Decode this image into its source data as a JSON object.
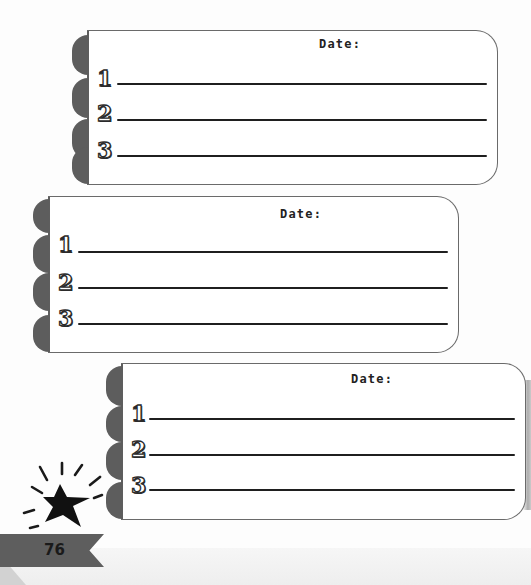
{
  "page": {
    "number": "76",
    "colors": {
      "accent_gray": "#5e5e5e",
      "ink": "#1f1f1f",
      "paper": "#ffffff"
    }
  },
  "cards": [
    {
      "date_label": "Date:",
      "items": [
        {
          "number": "1",
          "value": ""
        },
        {
          "number": "2",
          "value": ""
        },
        {
          "number": "3",
          "value": ""
        }
      ]
    },
    {
      "date_label": "Date:",
      "items": [
        {
          "number": "1",
          "value": ""
        },
        {
          "number": "2",
          "value": ""
        },
        {
          "number": "3",
          "value": ""
        }
      ]
    },
    {
      "date_label": "Date:",
      "items": [
        {
          "number": "1",
          "value": ""
        },
        {
          "number": "2",
          "value": ""
        },
        {
          "number": "3",
          "value": ""
        }
      ]
    }
  ],
  "decorations": {
    "star": "star-burst-icon",
    "ribbon": "page-number-ribbon"
  }
}
